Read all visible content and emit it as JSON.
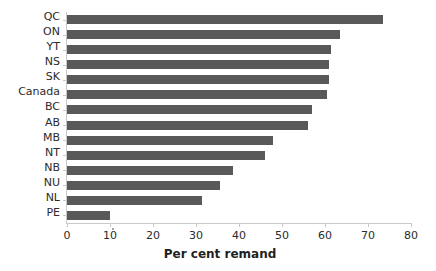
{
  "chart_data": {
    "type": "bar",
    "orientation": "horizontal",
    "title": "",
    "xlabel": "Per cent remand",
    "ylabel": "",
    "xlim": [
      0,
      80
    ],
    "xticks": [
      0,
      10,
      20,
      30,
      40,
      50,
      60,
      70,
      80
    ],
    "grid": false,
    "legend": null,
    "bar_color": "#595959",
    "axis_color": "#c9c9c9",
    "categories": [
      "QC",
      "ON",
      "YT",
      "NS",
      "SK",
      "Canada",
      "BC",
      "AB",
      "MB",
      "NT",
      "NB",
      "NU",
      "NL",
      "PE"
    ],
    "values": [
      73.5,
      63.5,
      61.5,
      61.0,
      61.0,
      60.5,
      57.0,
      56.0,
      48.0,
      46.0,
      38.5,
      35.5,
      31.5,
      10.0
    ],
    "series": [
      {
        "name": "Per cent remand",
        "values": [
          73.5,
          63.5,
          61.5,
          61.0,
          61.0,
          60.5,
          57.0,
          56.0,
          48.0,
          46.0,
          38.5,
          35.5,
          31.5,
          10.0
        ]
      }
    ]
  }
}
